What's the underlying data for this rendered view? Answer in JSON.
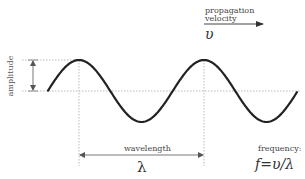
{
  "diagram": {
    "labels": {
      "amplitude": "amplitude",
      "propagation_line1": "propagation",
      "propagation_line2": "velocity",
      "velocity_symbol": "υ",
      "wavelength": "wavelength",
      "wavelength_symbol": "λ",
      "frequency": "frequency:",
      "frequency_formula": "f=υ/λ"
    },
    "colors": {
      "wave": "#222222",
      "guides": "#bbbbbb",
      "arrows": "#555555",
      "text": "#444444"
    },
    "geometry": {
      "baseline_y": 91,
      "amplitude_px": 31,
      "wavelength_px": 125,
      "wave_start_x": 48,
      "wave_end_x": 297,
      "first_peak_x": 79,
      "second_peak_x": 204
    }
  }
}
